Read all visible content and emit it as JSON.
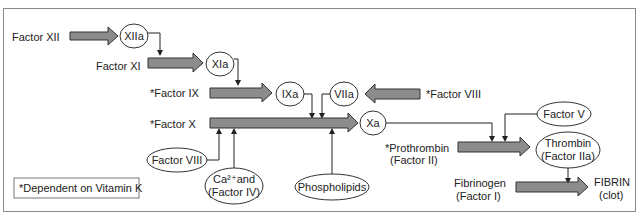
{
  "colors": {
    "arrow_fill": "#8c8c8c",
    "line": "#222222",
    "frame": "#8a8a8a"
  },
  "factors": {
    "xii": "Factor XII",
    "xi": "Factor XI",
    "ix": "*Factor IX",
    "viii_right": "*Factor VIII",
    "x": "*Factor X",
    "prothrombin_1": "*Prothrombin",
    "prothrombin_2": "(Factor II)",
    "fibrinogen_1": "Fibrinogen",
    "fibrinogen_2": "(Factor I)",
    "fibrin_1": "FIBRIN",
    "fibrin_2": "(clot)"
  },
  "nodes": {
    "xiia": "XIIa",
    "xia": "XIa",
    "ixa": "IXa",
    "viia": "VIIa",
    "xa": "Xa",
    "factor_v": "Factor V",
    "thrombin_1": "Thrombin",
    "thrombin_2": "(Factor IIa)",
    "factor_viii": "Factor VIII",
    "ca_1": "Ca²⁺and",
    "ca_2": "(Factor IV)",
    "phospholipids": "Phospholipids"
  },
  "note": "*Dependent on Vitamin K"
}
